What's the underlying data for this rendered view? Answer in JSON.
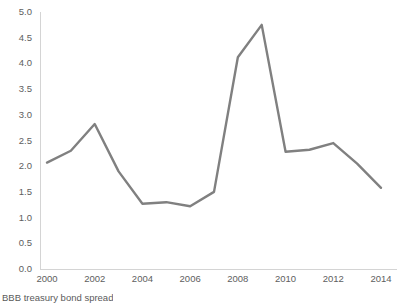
{
  "chart_data": {
    "type": "line",
    "title": "",
    "subtitle": "",
    "xlabel": "",
    "ylabel": "",
    "caption": "BBB treasury bond spread",
    "x": [
      2000,
      2001,
      2002,
      2003,
      2004,
      2005,
      2006,
      2007,
      2008,
      2009,
      2010,
      2011,
      2012,
      2013,
      2014
    ],
    "values": [
      2.07,
      2.3,
      2.82,
      1.9,
      1.27,
      1.3,
      1.22,
      1.5,
      4.12,
      4.75,
      2.28,
      2.32,
      2.45,
      2.05,
      1.58
    ],
    "series": [
      {
        "name": "BBB treasury bond spread",
        "values": [
          2.07,
          2.3,
          2.82,
          1.9,
          1.27,
          1.3,
          1.22,
          1.5,
          4.12,
          4.75,
          2.28,
          2.32,
          2.45,
          2.05,
          1.58
        ]
      }
    ],
    "xlim": [
      2000,
      2014
    ],
    "ylim": [
      0.0,
      5.0
    ],
    "y_ticks": [
      "0.0",
      "0.5",
      "1.0",
      "1.5",
      "2.0",
      "2.5",
      "3.0",
      "3.5",
      "4.0",
      "4.5",
      "5.0"
    ],
    "y_tick_values": [
      0.0,
      0.5,
      1.0,
      1.5,
      2.0,
      2.5,
      3.0,
      3.5,
      4.0,
      4.5,
      5.0
    ],
    "x_ticks": [
      "2000",
      "2002",
      "2004",
      "2006",
      "2008",
      "2010",
      "2012",
      "2014"
    ],
    "x_tick_values": [
      2000,
      2002,
      2004,
      2006,
      2008,
      2010,
      2012,
      2014
    ],
    "grid": false,
    "legend": false,
    "legend_position": "none",
    "markers": false,
    "line_color": "#808080",
    "line_width": 2.4,
    "axis_color": "#d4d4d4",
    "tick_label_color": "#5e5e5e",
    "background_color": "#ffffff"
  }
}
